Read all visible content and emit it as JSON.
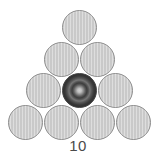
{
  "figure": {
    "caption": "10",
    "total_circles": 10,
    "rows": 4,
    "background_color": "#ffffff"
  },
  "colors": {
    "plain_fill": "#c9c9c9",
    "plain_stroke": "#8e8e8e",
    "marked_dark": "#2e2e2e",
    "marked_core": "#cfcfcf",
    "caption_text": "#4a4a4a"
  },
  "chart_data": {
    "type": "scatter",
    "title": "10",
    "xlabel": "",
    "ylabel": "",
    "xlim": [
      0,
      156
    ],
    "ylim": [
      0,
      162
    ],
    "grid": false,
    "legend": "none",
    "annotations": [
      "10"
    ],
    "series": [
      {
        "name": "plain-circles",
        "marker": "circle",
        "radius": 17.5,
        "fill": "#c9c9c9",
        "points": [
          {
            "id": "r1c1",
            "row": 1,
            "col": 1,
            "cx": 79.5,
            "cy": 27.5,
            "marked": false
          },
          {
            "id": "r2c1",
            "row": 2,
            "col": 1,
            "cx": 61.5,
            "cy": 59.0,
            "marked": false
          },
          {
            "id": "r2c2",
            "row": 2,
            "col": 2,
            "cx": 97.5,
            "cy": 59.0,
            "marked": false
          },
          {
            "id": "r3c1",
            "row": 3,
            "col": 1,
            "cx": 43.5,
            "cy": 90.5,
            "marked": false
          },
          {
            "id": "r3c3",
            "row": 3,
            "col": 3,
            "cx": 115.5,
            "cy": 90.5,
            "marked": false
          },
          {
            "id": "r4c1",
            "row": 4,
            "col": 1,
            "cx": 25.5,
            "cy": 122.0,
            "marked": false
          },
          {
            "id": "r4c2",
            "row": 4,
            "col": 2,
            "cx": 61.5,
            "cy": 122.0,
            "marked": false
          },
          {
            "id": "r4c3",
            "row": 4,
            "col": 3,
            "cx": 97.5,
            "cy": 122.0,
            "marked": false
          },
          {
            "id": "r4c4",
            "row": 4,
            "col": 4,
            "cx": 133.5,
            "cy": 122.0,
            "marked": false
          }
        ]
      },
      {
        "name": "marked-circle",
        "marker": "circle",
        "radius": 17.5,
        "fill": "#2e2e2e",
        "points": [
          {
            "id": "r3c2",
            "row": 3,
            "col": 2,
            "cx": 79.5,
            "cy": 90.5,
            "marked": true
          }
        ]
      }
    ],
    "row_counts": [
      1,
      2,
      3,
      4
    ],
    "values": [
      1,
      2,
      3,
      4
    ],
    "categories": [
      "row 1",
      "row 2",
      "row 3",
      "row 4"
    ]
  },
  "caption": {
    "text": "10",
    "x": 0,
    "y": 138
  }
}
